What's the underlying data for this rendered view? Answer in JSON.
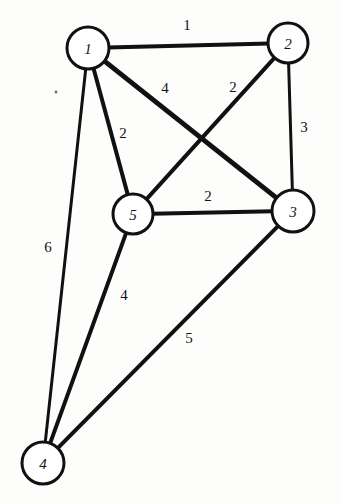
{
  "figure": {
    "background_color": "#fdfdfc",
    "stroke_color": "#111111",
    "node_fill_color": "#ffffff",
    "width": 342,
    "height": 504
  },
  "nodes": [
    {
      "id": "1",
      "label": "1",
      "x": 88,
      "y": 48,
      "r": 21
    },
    {
      "id": "2",
      "label": "2",
      "x": 288,
      "y": 43,
      "r": 20
    },
    {
      "id": "3",
      "label": "3",
      "x": 293,
      "y": 211,
      "r": 21
    },
    {
      "id": "4",
      "label": "4",
      "x": 43,
      "y": 463,
      "r": 21
    },
    {
      "id": "5",
      "label": "5",
      "x": 133,
      "y": 214,
      "r": 20
    }
  ],
  "edges": [
    {
      "id": "e-1-2",
      "from": "1",
      "to": "2",
      "weight": "1",
      "label_x": 187,
      "label_y": 25,
      "width": 4
    },
    {
      "id": "e-1-3",
      "from": "1",
      "to": "3",
      "weight": "4",
      "label_x": 165,
      "label_y": 88,
      "width": 5
    },
    {
      "id": "e-2-5",
      "from": "2",
      "to": "5",
      "weight": "2",
      "label_x": 233,
      "label_y": 87,
      "width": 4
    },
    {
      "id": "e-2-3",
      "from": "2",
      "to": "3",
      "weight": "3",
      "label_x": 304,
      "label_y": 127,
      "width": 3
    },
    {
      "id": "e-1-5",
      "from": "1",
      "to": "5",
      "weight": "2",
      "label_x": 123,
      "label_y": 133,
      "width": 4
    },
    {
      "id": "e-5-3",
      "from": "5",
      "to": "3",
      "weight": "2",
      "label_x": 208,
      "label_y": 196,
      "width": 4
    },
    {
      "id": "e-1-4",
      "from": "1",
      "to": "4",
      "weight": "6",
      "label_x": 48,
      "label_y": 247,
      "width": 3
    },
    {
      "id": "e-5-4",
      "from": "5",
      "to": "4",
      "weight": "4",
      "label_x": 124,
      "label_y": 295,
      "width": 4
    },
    {
      "id": "e-3-4",
      "from": "3",
      "to": "4",
      "weight": "5",
      "label_x": 189,
      "label_y": 338,
      "width": 4
    }
  ],
  "chart_data": {
    "type": "diagram",
    "subtype": "weighted-graph",
    "directed": false,
    "node_ids": [
      "1",
      "2",
      "3",
      "4",
      "5"
    ],
    "edge_list": [
      {
        "source": "1",
        "target": "2",
        "weight": 1
      },
      {
        "source": "1",
        "target": "3",
        "weight": 4
      },
      {
        "source": "1",
        "target": "5",
        "weight": 2
      },
      {
        "source": "1",
        "target": "4",
        "weight": 6
      },
      {
        "source": "2",
        "target": "5",
        "weight": 2
      },
      {
        "source": "2",
        "target": "3",
        "weight": 3
      },
      {
        "source": "5",
        "target": "3",
        "weight": 2
      },
      {
        "source": "5",
        "target": "4",
        "weight": 4
      },
      {
        "source": "3",
        "target": "4",
        "weight": 5
      }
    ],
    "node_count": 5,
    "edge_count": 9,
    "weights": [
      1,
      4,
      2,
      6,
      2,
      3,
      2,
      4,
      5
    ]
  },
  "artifacts": [
    {
      "id": "speck-left",
      "x": 56,
      "y": 92,
      "r": 1.4
    }
  ]
}
